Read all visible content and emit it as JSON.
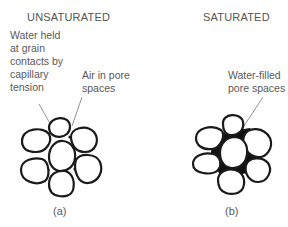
{
  "panels": [
    {
      "id": "a",
      "title": "UNSATURATED",
      "caption": "(a)",
      "annotations": [
        {
          "text": "Water held\nat grain\ncontacts by\ncapillary\ntension"
        },
        {
          "text": "Air in pore\nspaces"
        }
      ]
    },
    {
      "id": "b",
      "title": "SATURATED",
      "caption": "(b)",
      "annotations": [
        {
          "text": "Water-filled\npore spaces"
        }
      ]
    }
  ],
  "colors": {
    "grain_outline": "#1a1a1a",
    "water_fill": "#111111",
    "text": "#5a5a5a"
  }
}
